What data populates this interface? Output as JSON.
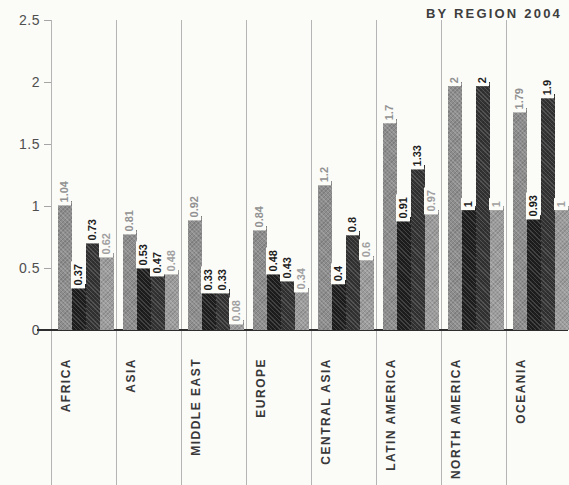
{
  "title": "BY REGION 2004",
  "colors": {
    "background": "#fbfbf8",
    "grid": "#b5b5b5",
    "axis_line": "#2e2e2e",
    "tick_label": "#4f4f4f",
    "category_label": "#383838",
    "title": "#3e3e3e"
  },
  "chart_data": {
    "type": "bar",
    "title": "BY REGION 2004",
    "categories": [
      "AFRICA",
      "ASIA",
      "MIDDLE EAST",
      "EUROPE",
      "CENTRAL ASIA",
      "LATIN AMERICA",
      "NORTH AMERICA",
      "OCEANIA"
    ],
    "series": [
      {
        "name": "series-1",
        "color": "#8d8d8d",
        "label_color": "#929292",
        "values": [
          1.04,
          0.81,
          0.92,
          0.84,
          1.2,
          1.7,
          2,
          1.79
        ],
        "labels": [
          "1.04",
          "0.81",
          "0.92",
          "0.84",
          "1.2",
          "1.7",
          "2",
          "1.79"
        ]
      },
      {
        "name": "series-2",
        "color": "#1e1e1e",
        "label_color": "#1a1a1a",
        "values": [
          0.37,
          0.53,
          0.33,
          0.48,
          0.4,
          0.91,
          1,
          0.93
        ],
        "labels": [
          "0.37",
          "0.53",
          "0.33",
          "0.48",
          "0.4",
          "0.91",
          "1",
          "0.93"
        ]
      },
      {
        "name": "series-3",
        "color": "#333333",
        "label_color": "#1f1f1f",
        "values": [
          0.73,
          0.47,
          0.33,
          0.43,
          0.8,
          1.33,
          2,
          1.9
        ],
        "labels": [
          "0.73",
          "0.47",
          "0.33",
          "0.43",
          "0.8",
          "1.33",
          "2",
          "1.9"
        ]
      },
      {
        "name": "series-4",
        "color": "#9c9c9c",
        "label_color": "#a0a0a0",
        "values": [
          0.62,
          0.48,
          0.08,
          0.34,
          0.6,
          0.97,
          1,
          1
        ],
        "labels": [
          "0.62",
          "0.48",
          "0.08",
          "0.34",
          "0.6",
          "0.97",
          "1",
          "1"
        ]
      }
    ],
    "ylim": [
      0,
      2.5
    ],
    "yticks": [
      "0",
      "0.5",
      "1",
      "1.5",
      "2",
      "2.5"
    ],
    "legend": "none",
    "grid": "vertical-category-separators"
  }
}
